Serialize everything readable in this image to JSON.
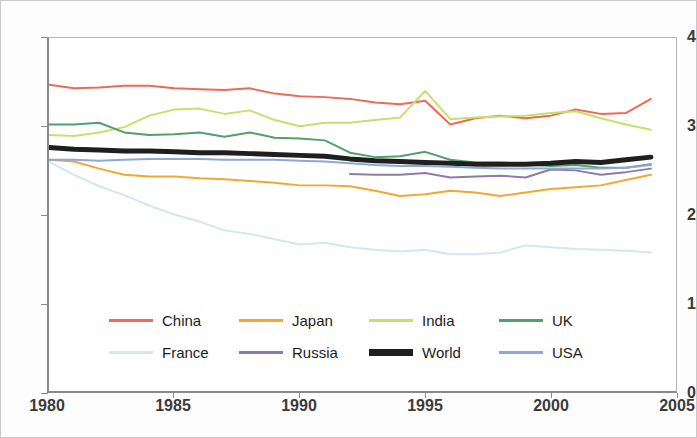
{
  "chart_data": {
    "type": "line",
    "title": "",
    "xlabel": "",
    "ylabel": "",
    "xlim": [
      1980,
      2005
    ],
    "ylim": [
      0,
      4
    ],
    "grid": false,
    "legend_position": "inside-bottom",
    "x_ticks": [
      "1980",
      "1985",
      "1990",
      "1995",
      "2000",
      "2005"
    ],
    "x_tick_values": [
      1980,
      1985,
      1990,
      1995,
      2000,
      2005
    ],
    "y_ticks": [
      "0",
      "1",
      "2",
      "3",
      "4"
    ],
    "y_tick_values": [
      0,
      1,
      2,
      3,
      4
    ],
    "x": [
      1980,
      1981,
      1982,
      1983,
      1984,
      1985,
      1986,
      1987,
      1988,
      1989,
      1990,
      1991,
      1992,
      1993,
      1994,
      1995,
      1996,
      1997,
      1998,
      1999,
      2000,
      2001,
      2002,
      2003,
      2004
    ],
    "series": [
      {
        "name": "China",
        "color": "#ED6A56",
        "width": 2,
        "x": [
          1980,
          1981,
          1982,
          1983,
          1984,
          1985,
          1986,
          1987,
          1988,
          1989,
          1990,
          1991,
          1992,
          1993,
          1994,
          1995,
          1996,
          1997,
          1998,
          1999,
          2000,
          2001,
          2002,
          2003,
          2004
        ],
        "values": [
          3.47,
          3.43,
          3.44,
          3.46,
          3.46,
          3.43,
          3.42,
          3.41,
          3.43,
          3.37,
          3.34,
          3.33,
          3.31,
          3.27,
          3.25,
          3.29,
          3.02,
          3.09,
          3.12,
          3.09,
          3.12,
          3.19,
          3.14,
          3.15,
          3.31
        ]
      },
      {
        "name": "Japan",
        "color": "#F0A830",
        "width": 2,
        "x": [
          1980,
          1981,
          1982,
          1983,
          1984,
          1985,
          1986,
          1987,
          1988,
          1989,
          1990,
          1991,
          1992,
          1993,
          1994,
          1995,
          1996,
          1997,
          1998,
          1999,
          2000,
          2001,
          2002,
          2003,
          2004
        ],
        "values": [
          2.62,
          2.6,
          2.52,
          2.45,
          2.43,
          2.43,
          2.41,
          2.4,
          2.38,
          2.36,
          2.33,
          2.33,
          2.32,
          2.27,
          2.21,
          2.23,
          2.27,
          2.25,
          2.21,
          2.25,
          2.29,
          2.31,
          2.33,
          2.39,
          2.45
        ]
      },
      {
        "name": "India",
        "color": "#C6E06A",
        "width": 2,
        "x": [
          1980,
          1981,
          1982,
          1983,
          1984,
          1985,
          1986,
          1987,
          1988,
          1989,
          1990,
          1991,
          1992,
          1993,
          1994,
          1995,
          1996,
          1997,
          1998,
          1999,
          2000,
          2001,
          2002,
          2003,
          2004
        ],
        "values": [
          2.9,
          2.89,
          2.93,
          2.99,
          3.12,
          3.19,
          3.2,
          3.14,
          3.18,
          3.07,
          3.0,
          3.04,
          3.04,
          3.07,
          3.1,
          3.4,
          3.08,
          3.1,
          3.11,
          3.12,
          3.15,
          3.17,
          3.09,
          3.02,
          2.96
        ]
      },
      {
        "name": "UK",
        "color": "#52A06A",
        "width": 2,
        "x": [
          1980,
          1981,
          1982,
          1983,
          1984,
          1985,
          1986,
          1987,
          1988,
          1989,
          1990,
          1991,
          1992,
          1993,
          1994,
          1995,
          1996,
          1997,
          1998,
          1999,
          2000,
          2001,
          2002,
          2003,
          2004
        ],
        "values": [
          3.02,
          3.02,
          3.04,
          2.93,
          2.9,
          2.91,
          2.93,
          2.88,
          2.93,
          2.87,
          2.86,
          2.84,
          2.7,
          2.65,
          2.66,
          2.71,
          2.62,
          2.59,
          2.59,
          2.57,
          2.55,
          2.56,
          2.53,
          2.53,
          2.57
        ]
      },
      {
        "name": "France",
        "color": "#CFE9EC",
        "width": 2,
        "x": [
          1980,
          1981,
          1982,
          1983,
          1984,
          1985,
          1986,
          1987,
          1988,
          1989,
          1990,
          1991,
          1992,
          1993,
          1994,
          1995,
          1996,
          1997,
          1998,
          1999,
          2000,
          2001,
          2002,
          2003,
          2004
        ],
        "values": [
          2.6,
          2.45,
          2.32,
          2.22,
          2.1,
          2.0,
          1.92,
          1.82,
          1.78,
          1.72,
          1.66,
          1.68,
          1.63,
          1.6,
          1.58,
          1.6,
          1.55,
          1.55,
          1.57,
          1.65,
          1.63,
          1.61,
          1.6,
          1.59,
          1.57
        ]
      },
      {
        "name": "Russia",
        "color": "#8D7BA8",
        "width": 2,
        "x": [
          1992,
          1993,
          1994,
          1995,
          1996,
          1997,
          1998,
          1999,
          2000,
          2001,
          2002,
          2003,
          2004
        ],
        "values": [
          2.46,
          2.45,
          2.45,
          2.47,
          2.42,
          2.43,
          2.44,
          2.42,
          2.51,
          2.5,
          2.45,
          2.48,
          2.52
        ]
      },
      {
        "name": "World",
        "color": "#1f1f1f",
        "width": 5,
        "x": [
          1980,
          1981,
          1982,
          1983,
          1984,
          1985,
          1986,
          1987,
          1988,
          1989,
          1990,
          1991,
          1992,
          1993,
          1994,
          1995,
          1996,
          1997,
          1998,
          1999,
          2000,
          2001,
          2002,
          2003,
          2004
        ],
        "values": [
          2.76,
          2.74,
          2.73,
          2.72,
          2.72,
          2.71,
          2.7,
          2.7,
          2.69,
          2.68,
          2.67,
          2.66,
          2.63,
          2.61,
          2.6,
          2.59,
          2.58,
          2.57,
          2.57,
          2.57,
          2.58,
          2.6,
          2.59,
          2.62,
          2.65
        ]
      },
      {
        "name": "USA",
        "color": "#8FA6D8",
        "width": 2,
        "x": [
          1980,
          1981,
          1982,
          1983,
          1984,
          1985,
          1986,
          1987,
          1988,
          1989,
          1990,
          1991,
          1992,
          1993,
          1994,
          1995,
          1996,
          1997,
          1998,
          1999,
          2000,
          2001,
          2002,
          2003,
          2004
        ],
        "values": [
          2.62,
          2.62,
          2.61,
          2.62,
          2.63,
          2.63,
          2.63,
          2.62,
          2.62,
          2.62,
          2.61,
          2.6,
          2.58,
          2.56,
          2.55,
          2.55,
          2.54,
          2.53,
          2.52,
          2.52,
          2.52,
          2.52,
          2.52,
          2.53,
          2.56
        ]
      }
    ]
  },
  "legend": {
    "rows": [
      [
        {
          "label": "China",
          "color": "#ED6A56",
          "width": 3
        },
        {
          "label": "Japan",
          "color": "#F0A830",
          "width": 3
        },
        {
          "label": "India",
          "color": "#C6E06A",
          "width": 3
        },
        {
          "label": "UK",
          "color": "#52A06A",
          "width": 3
        }
      ],
      [
        {
          "label": "France",
          "color": "#CFE9EC",
          "width": 3
        },
        {
          "label": "Russia",
          "color": "#8D7BA8",
          "width": 3
        },
        {
          "label": "World",
          "color": "#1f1f1f",
          "width": 7
        },
        {
          "label": "USA",
          "color": "#8FA6D8",
          "width": 3
        }
      ]
    ]
  }
}
